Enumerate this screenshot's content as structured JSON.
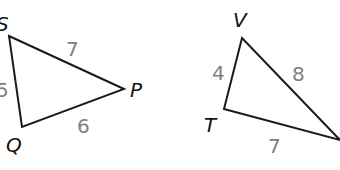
{
  "figures": [
    {
      "name": "triangle-SPQ",
      "vertices": [
        {
          "label": "S",
          "x": 9,
          "y": 36,
          "lx": -4,
          "ly": 31
        },
        {
          "label": "P",
          "x": 124,
          "y": 89,
          "lx": 130,
          "ly": 97
        },
        {
          "label": "Q",
          "x": 22,
          "y": 127,
          "lx": 6,
          "ly": 152
        }
      ],
      "sides": [
        {
          "name": "SP",
          "value": "7",
          "lx": 66,
          "ly": 56
        },
        {
          "name": "SQ",
          "value": "5",
          "lx": -4,
          "ly": 97
        },
        {
          "name": "QP",
          "value": "6",
          "lx": 77,
          "ly": 133
        }
      ]
    },
    {
      "name": "triangle-VT",
      "vertices": [
        {
          "label": "V",
          "x": 242,
          "y": 38,
          "lx": 233,
          "ly": 27
        },
        {
          "label": "T",
          "x": 224,
          "y": 109,
          "lx": 204,
          "ly": 132
        },
        {
          "label": "",
          "x": 340,
          "y": 140,
          "lx": 340,
          "ly": 140
        }
      ],
      "sides": [
        {
          "name": "VT",
          "value": "4",
          "lx": 212,
          "ly": 80
        },
        {
          "name": "V-third",
          "value": "8",
          "lx": 292,
          "ly": 81
        },
        {
          "name": "T-third",
          "value": "7",
          "lx": 268,
          "ly": 153
        }
      ]
    }
  ],
  "colors": {
    "edge": "#1a1a1a",
    "vertex_label": "#111111",
    "side_label": "#808080"
  }
}
